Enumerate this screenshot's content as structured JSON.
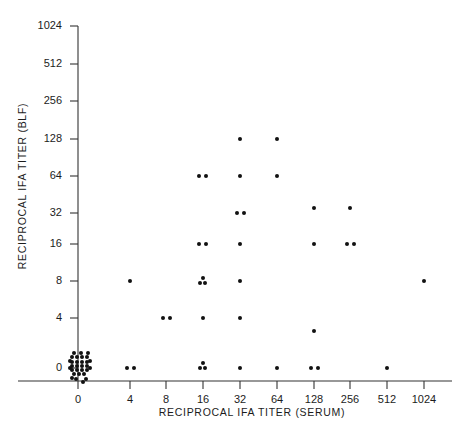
{
  "chart_data": {
    "type": "scatter",
    "title": "",
    "xlabel": "RECIPROCAL IFA TITER  (SERUM)",
    "ylabel": "RECIPROCAL IFA TITER (BLF)",
    "x_tick_labels": [
      "0",
      "4",
      "8",
      "16",
      "32",
      "64",
      "128",
      "256",
      "512",
      "1024"
    ],
    "y_tick_labels": [
      "0",
      "4",
      "8",
      "16",
      "32",
      "64",
      "128",
      "256",
      "512",
      "1024"
    ],
    "x_tick_px": [
      78,
      130,
      166,
      203,
      240,
      277,
      314,
      350,
      387,
      424
    ],
    "y_tick_px": [
      368,
      318,
      281,
      244,
      213,
      176,
      139,
      101,
      64,
      26
    ],
    "axis_scale": "log2-like ordinal (0 then doubling)",
    "grid": false,
    "legend": null,
    "marker": "filled-circle",
    "marker_color": "#111111",
    "points": [
      {
        "x": "0",
        "y": "0",
        "count": 30,
        "note": "dense saturated cluster at origin"
      },
      {
        "x": "4",
        "y": "0",
        "count": 2
      },
      {
        "x": "4",
        "y": "8",
        "count": 1
      },
      {
        "x": "8",
        "y": "4",
        "count": 2
      },
      {
        "x": "16",
        "y": "0",
        "count": 3
      },
      {
        "x": "16",
        "y": "4",
        "count": 1
      },
      {
        "x": "16",
        "y": "8",
        "count": 3
      },
      {
        "x": "16",
        "y": "16",
        "count": 2
      },
      {
        "x": "16",
        "y": "64",
        "count": 2
      },
      {
        "x": "32",
        "y": "0",
        "count": 1
      },
      {
        "x": "32",
        "y": "4",
        "count": 1
      },
      {
        "x": "32",
        "y": "8",
        "count": 1
      },
      {
        "x": "32",
        "y": "16",
        "count": 1
      },
      {
        "x": "32",
        "y": "32",
        "count": 2
      },
      {
        "x": "32",
        "y": "64",
        "count": 1
      },
      {
        "x": "32",
        "y": "128",
        "count": 1
      },
      {
        "x": "64",
        "y": "0",
        "count": 1
      },
      {
        "x": "64",
        "y": "64",
        "count": 1
      },
      {
        "x": "64",
        "y": "128",
        "count": 1
      },
      {
        "x": "128",
        "y": "0",
        "count": 2
      },
      {
        "x": "128",
        "y": "2",
        "count": 1
      },
      {
        "x": "128",
        "y": "16",
        "count": 1
      },
      {
        "x": "128",
        "y": "32",
        "count": 1
      },
      {
        "x": "256",
        "y": "16",
        "count": 2
      },
      {
        "x": "256",
        "y": "32",
        "count": 1
      },
      {
        "x": "512",
        "y": "0",
        "count": 1
      },
      {
        "x": "1024",
        "y": "8",
        "count": 1
      }
    ],
    "plotted_markers": [
      {
        "cx": 72,
        "cy": 357
      },
      {
        "cx": 77,
        "cy": 357
      },
      {
        "cx": 82,
        "cy": 357
      },
      {
        "cx": 87,
        "cy": 357
      },
      {
        "cx": 72,
        "cy": 362
      },
      {
        "cx": 77,
        "cy": 362
      },
      {
        "cx": 82,
        "cy": 362
      },
      {
        "cx": 87,
        "cy": 362
      },
      {
        "cx": 72,
        "cy": 366
      },
      {
        "cx": 77,
        "cy": 366
      },
      {
        "cx": 82,
        "cy": 366
      },
      {
        "cx": 87,
        "cy": 366
      },
      {
        "cx": 72,
        "cy": 370
      },
      {
        "cx": 77,
        "cy": 370
      },
      {
        "cx": 82,
        "cy": 370
      },
      {
        "cx": 87,
        "cy": 370
      },
      {
        "cx": 74,
        "cy": 374
      },
      {
        "cx": 79,
        "cy": 374
      },
      {
        "cx": 84,
        "cy": 374
      },
      {
        "cx": 70,
        "cy": 361
      },
      {
        "cx": 90,
        "cy": 361
      },
      {
        "cx": 70,
        "cy": 368
      },
      {
        "cx": 90,
        "cy": 368
      },
      {
        "cx": 76,
        "cy": 379
      },
      {
        "cx": 86,
        "cy": 379
      },
      {
        "cx": 81,
        "cy": 353
      },
      {
        "cx": 74,
        "cy": 353
      },
      {
        "cx": 88,
        "cy": 353
      },
      {
        "cx": 72,
        "cy": 378
      },
      {
        "cx": 83,
        "cy": 382
      },
      {
        "cx": 127,
        "cy": 368
      },
      {
        "cx": 134,
        "cy": 368
      },
      {
        "cx": 130,
        "cy": 281
      },
      {
        "cx": 163,
        "cy": 318
      },
      {
        "cx": 170,
        "cy": 318
      },
      {
        "cx": 200,
        "cy": 368
      },
      {
        "cx": 205,
        "cy": 368
      },
      {
        "cx": 203,
        "cy": 363
      },
      {
        "cx": 203,
        "cy": 318
      },
      {
        "cx": 200,
        "cy": 283
      },
      {
        "cx": 205,
        "cy": 283
      },
      {
        "cx": 203,
        "cy": 278
      },
      {
        "cx": 199,
        "cy": 244
      },
      {
        "cx": 206,
        "cy": 244
      },
      {
        "cx": 199,
        "cy": 176
      },
      {
        "cx": 206,
        "cy": 176
      },
      {
        "cx": 240,
        "cy": 368
      },
      {
        "cx": 240,
        "cy": 318
      },
      {
        "cx": 240,
        "cy": 281
      },
      {
        "cx": 240,
        "cy": 244
      },
      {
        "cx": 237,
        "cy": 213
      },
      {
        "cx": 244,
        "cy": 213
      },
      {
        "cx": 240,
        "cy": 176
      },
      {
        "cx": 240,
        "cy": 139
      },
      {
        "cx": 277,
        "cy": 368
      },
      {
        "cx": 277,
        "cy": 176
      },
      {
        "cx": 277,
        "cy": 139
      },
      {
        "cx": 311,
        "cy": 368
      },
      {
        "cx": 318,
        "cy": 368
      },
      {
        "cx": 314,
        "cy": 331
      },
      {
        "cx": 314,
        "cy": 244
      },
      {
        "cx": 314,
        "cy": 208
      },
      {
        "cx": 347,
        "cy": 244
      },
      {
        "cx": 354,
        "cy": 244
      },
      {
        "cx": 350,
        "cy": 208
      },
      {
        "cx": 387,
        "cy": 368
      },
      {
        "cx": 424,
        "cy": 281
      }
    ]
  }
}
